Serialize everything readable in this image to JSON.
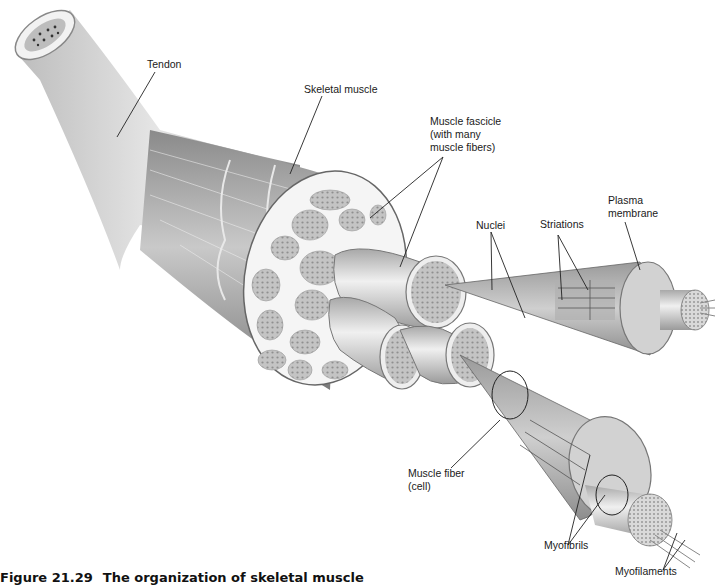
{
  "figure": {
    "caption_number": "Figure 21.29",
    "caption_title": "The organization of skeletal muscle",
    "colors": {
      "background": "#ffffff",
      "tissue_dark": "#6f6f6f",
      "tissue_mid": "#9a9a9a",
      "tissue_light": "#d6d6d6",
      "cross_section": "#f4f4f4",
      "fascicle_fill": "#b9b9b9",
      "leader_line": "#222222",
      "label_text": "#1a1a1a"
    }
  },
  "labels": {
    "tendon": "Tendon",
    "skeletal_muscle": "Skeletal muscle",
    "muscle_fascicle": "Muscle fascicle\n(with many\nmuscle fibers)",
    "nuclei": "Nuclei",
    "striations": "Striations",
    "plasma_membrane": "Plasma\nmembrane",
    "muscle_fiber": "Muscle fiber\n(cell)",
    "myofibrils": "Myofibrils",
    "myofilaments": "Myofilaments"
  }
}
